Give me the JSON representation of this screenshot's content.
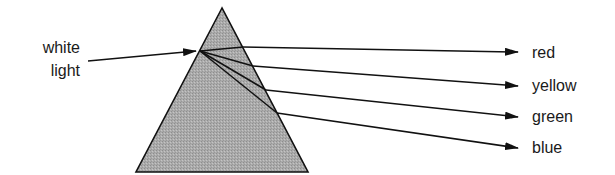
{
  "diagram": {
    "input_label_line1": "white",
    "input_label_line2": "light",
    "outputs": [
      {
        "label": "red"
      },
      {
        "label": "yellow"
      },
      {
        "label": "green"
      },
      {
        "label": "blue"
      }
    ],
    "colors": {
      "prism_fill": "#a9a9a9",
      "stroke": "#111111",
      "background": "#ffffff"
    }
  }
}
